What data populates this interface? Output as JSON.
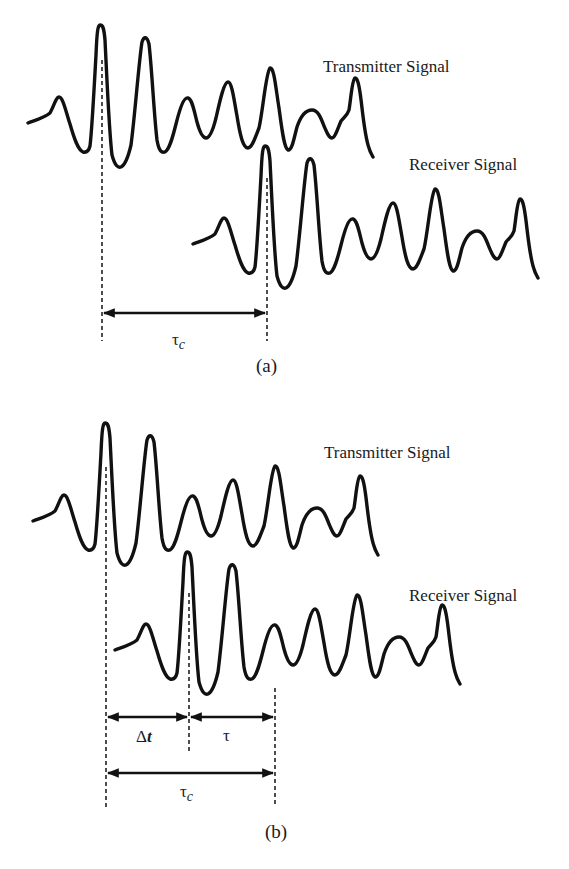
{
  "panels": [
    {
      "caption": "(a)",
      "transmitter_label": "Transmitter Signal",
      "receiver_label": "Receiver Signal",
      "intervals": [
        {
          "symbol": "τ",
          "subscript": "c"
        }
      ]
    },
    {
      "caption": "(b)",
      "transmitter_label": "Transmitter Signal",
      "receiver_label": "Receiver Signal",
      "intervals": [
        {
          "symbol": "Δ",
          "italic": "t"
        },
        {
          "symbol": "τ"
        },
        {
          "symbol": "τ",
          "subscript": "c"
        }
      ]
    }
  ],
  "colors": {
    "stroke": "#111111",
    "background": "#ffffff"
  }
}
